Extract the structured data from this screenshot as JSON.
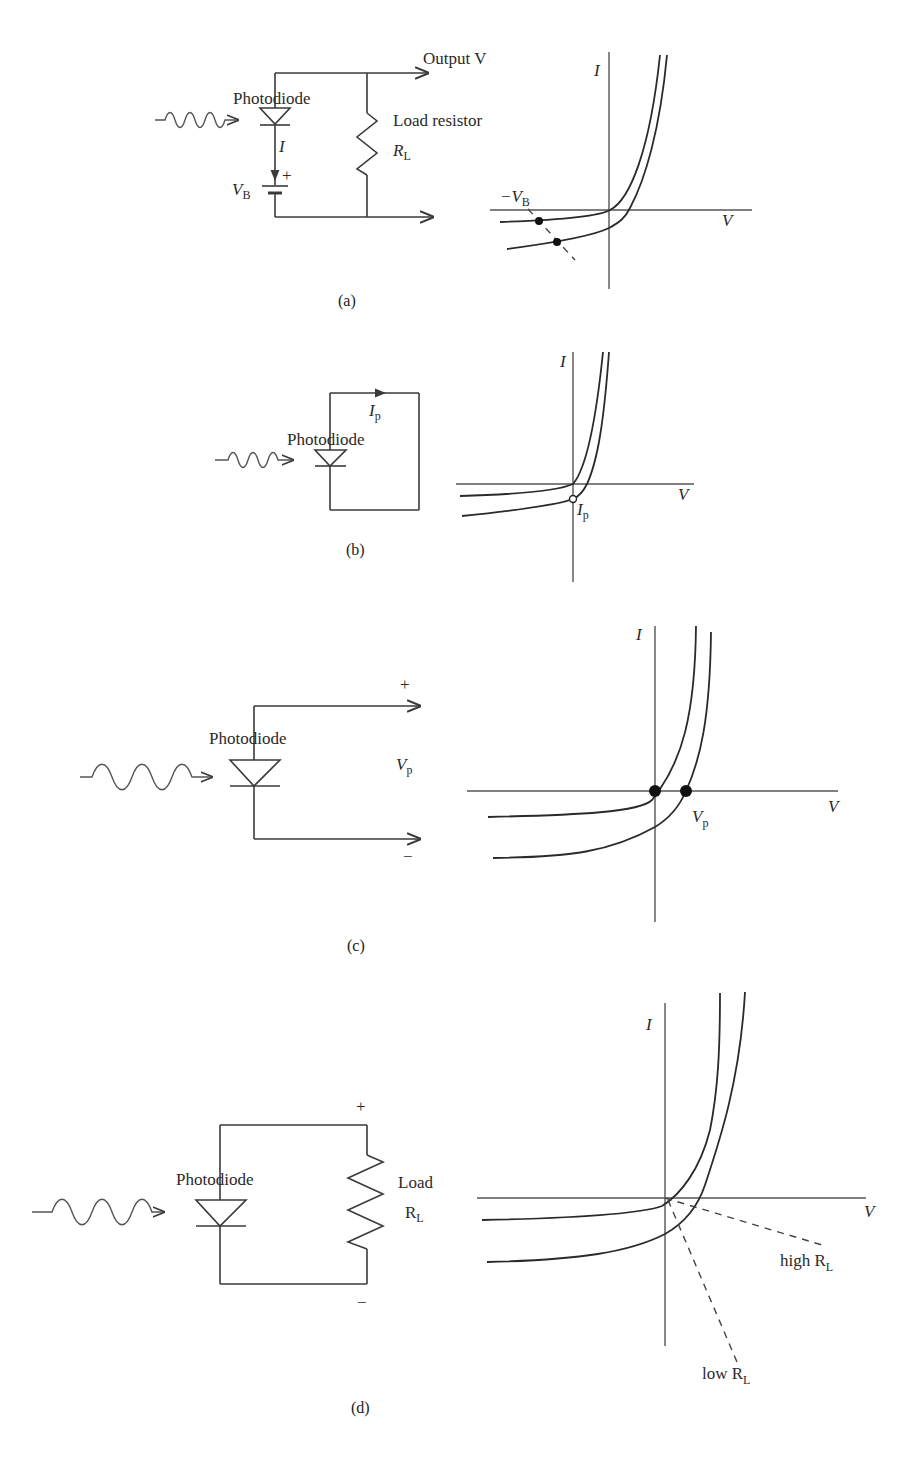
{
  "figure": {
    "panels": [
      {
        "id": "a",
        "caption": "(a)",
        "circuit": {
          "light_source": "wavy-arrow",
          "diode_label": "Photodiode",
          "current_label": "I",
          "bias_label": "V",
          "bias_sub": "B",
          "bias_polarity": "+",
          "load_label": "Load resistor",
          "load_symbol": "R",
          "load_sub": "L",
          "output_label": "Output V"
        },
        "graph": {
          "y_axis_label": "I",
          "x_axis_label": "V",
          "annotation": "−V",
          "annotation_sub": "B",
          "curves": [
            "dark",
            "illuminated"
          ],
          "markers": 2,
          "load_line": "dashed"
        }
      },
      {
        "id": "b",
        "caption": "(b)",
        "circuit": {
          "light_source": "wavy-arrow",
          "diode_label": "Photodiode",
          "current_label": "I",
          "current_sub": "p",
          "mode": "short-circuit"
        },
        "graph": {
          "y_axis_label": "I",
          "x_axis_label": "V",
          "annotation": "I",
          "annotation_sub": "p",
          "curves": [
            "dark",
            "illuminated"
          ],
          "markers": 1
        }
      },
      {
        "id": "c",
        "caption": "(c)",
        "circuit": {
          "light_source": "wavy-arrow",
          "diode_label": "Photodiode",
          "voltage_label": "V",
          "voltage_sub": "p",
          "plus": "+",
          "minus": "−",
          "mode": "open-circuit"
        },
        "graph": {
          "y_axis_label": "I",
          "x_axis_label": "V",
          "annotation": "V",
          "annotation_sub": "p",
          "curves": [
            "dark",
            "illuminated"
          ],
          "markers": 2
        }
      },
      {
        "id": "d",
        "caption": "(d)",
        "circuit": {
          "light_source": "wavy-arrow",
          "diode_label": "Photodiode",
          "load_label": "Load",
          "load_symbol": "R",
          "load_sub": "L",
          "plus": "+",
          "minus": "−"
        },
        "graph": {
          "y_axis_label": "I",
          "x_axis_label": "V",
          "curves": [
            "dark",
            "illuminated"
          ],
          "load_lines": [
            {
              "label": "high R",
              "sub": "L"
            },
            {
              "label": "low R",
              "sub": "L"
            }
          ]
        }
      }
    ]
  }
}
